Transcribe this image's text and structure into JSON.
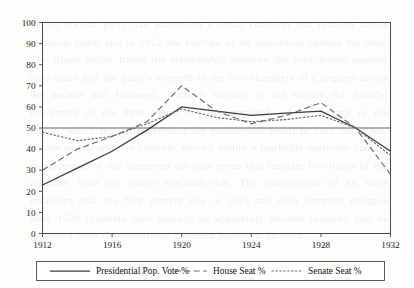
{
  "page": {
    "ghost_text": "of the era the party had assembled a broad coalition that reached across sectional lines, and in 1912 the fracture of its opposition opened the door. The figure below traces the relationship between the presidential popular vote share and the party's strength in the two chambers of Congress across the decade that followed. What is striking is not simply the parallel movement of the three series but the amplitude of the swings in the House, which regularly overshot the presidential result in both directions. Senate seat shares, by contrast, moved within a markedly narrower band, a consequence of the staggered six-year terms that insulate two-thirds of the chamber from any single electoral tide. The convergence of all three measures near the fifty percent line in 1924 and their common collapse after 1928 illustrate how quickly an apparently durable majority can be unwound once the underlying coalition begins to dissolve."
  },
  "chart_data": {
    "type": "line",
    "title": "",
    "xlabel": "",
    "ylabel": "",
    "xlim": [
      1912,
      1932
    ],
    "ylim": [
      0,
      100
    ],
    "grid": false,
    "reference_lines": [
      {
        "axis": "y",
        "value": 50
      }
    ],
    "yticks": [
      0,
      10,
      20,
      30,
      40,
      50,
      60,
      70,
      80,
      90,
      100
    ],
    "ytick_labels": [
      "0",
      "10",
      "20",
      "30",
      "40",
      "50",
      "60",
      "70",
      "80",
      "90",
      "100"
    ],
    "xticks": [
      1912,
      1916,
      1920,
      1924,
      1928,
      1932
    ],
    "xtick_labels": [
      "1912",
      "1916",
      "1920",
      "1924",
      "1928",
      "1932"
    ],
    "x": [
      1912,
      1914,
      1916,
      1918,
      1920,
      1922,
      1924,
      1926,
      1928,
      1930,
      1932
    ],
    "legend_position": "below",
    "series": [
      {
        "name": "Presidential Pop. Vote %",
        "style": "solid",
        "color": "#3c3c46",
        "values": [
          23,
          31,
          39,
          49,
          60,
          58,
          56,
          57,
          58,
          50,
          39
        ]
      },
      {
        "name": "House Seat %",
        "style": "dashed",
        "color": "#6a6a74",
        "values": [
          30,
          40,
          46,
          53,
          70,
          58,
          52,
          56,
          62,
          50,
          28
        ]
      },
      {
        "name": "Senate Seat %",
        "style": "dotted",
        "color": "#6a6a74",
        "values": [
          48,
          44,
          46,
          52,
          59,
          55,
          53,
          54,
          56,
          50,
          37
        ]
      }
    ]
  }
}
